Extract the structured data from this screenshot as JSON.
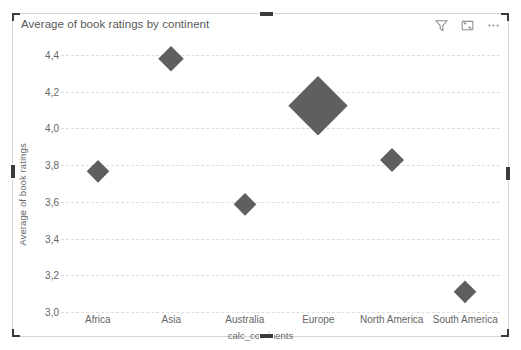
{
  "visual": {
    "title": "Average of book ratings by continent",
    "header_actions": [
      {
        "name": "filter-icon",
        "label": "Filters"
      },
      {
        "name": "focus-mode-icon",
        "label": "Focus mode"
      },
      {
        "name": "more-options-icon",
        "label": "More options"
      }
    ],
    "selected": true
  },
  "chart_data": {
    "type": "scatter",
    "title": "Average of book ratings by continent",
    "xlabel": "calc_continents",
    "ylabel": "Average of book ratings",
    "categories": [
      "Africa",
      "Asia",
      "Australia",
      "Europe",
      "North America",
      "South America"
    ],
    "values": [
      3.77,
      4.38,
      3.59,
      4.12,
      3.83,
      3.11
    ],
    "sizes": [
      22,
      26,
      22,
      60,
      24,
      23
    ],
    "ylim": [
      3.0,
      4.4
    ],
    "yticks": [
      "3,0",
      "3,2",
      "3,4",
      "3,6",
      "3,8",
      "4,0",
      "4,2",
      "4,4"
    ],
    "ytick_values": [
      3.0,
      3.2,
      3.4,
      3.6,
      3.8,
      4.0,
      4.2,
      4.4
    ],
    "grid": true,
    "legend": "none",
    "marker_color": "#5f5f5f",
    "marker_shape": "diamond",
    "points": [
      {
        "category": "Africa",
        "value": 3.77,
        "size": 22
      },
      {
        "category": "Asia",
        "value": 4.38,
        "size": 26
      },
      {
        "category": "Australia",
        "value": 3.59,
        "size": 22
      },
      {
        "category": "Europe",
        "value": 4.12,
        "size": 60
      },
      {
        "category": "North America",
        "value": 3.83,
        "size": 24
      },
      {
        "category": "South America",
        "value": 3.11,
        "size": 23
      }
    ]
  }
}
